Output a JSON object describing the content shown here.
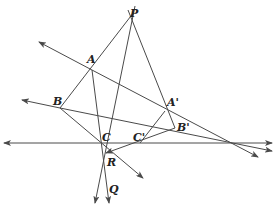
{
  "diagram": {
    "colors": {
      "line": "#4a4a4a",
      "label": "#222222",
      "background": "#ffffff"
    },
    "points": {
      "P": {
        "label": "P",
        "x": 129,
        "y": 14
      },
      "A": {
        "label": "A",
        "x": 92,
        "y": 70
      },
      "B": {
        "label": "B",
        "x": 60,
        "y": 108
      },
      "C": {
        "label": "C",
        "x": 102,
        "y": 143
      },
      "A_prime": {
        "label": "A'",
        "x": 165,
        "y": 111
      },
      "B_prime": {
        "label": "B'",
        "x": 175,
        "y": 128
      },
      "C_prime": {
        "label": "C'",
        "x": 140,
        "y": 143
      },
      "R": {
        "label": "R",
        "x": 106,
        "y": 153
      },
      "Q": {
        "label": "Q",
        "x": 107,
        "y": 182
      }
    },
    "labels": [
      {
        "id": "P",
        "text": "P",
        "x": 130,
        "y": 17
      },
      {
        "id": "A",
        "text": "A",
        "x": 87,
        "y": 63
      },
      {
        "id": "B",
        "text": "B",
        "x": 53,
        "y": 105
      },
      {
        "id": "C",
        "text": "C",
        "x": 102,
        "y": 141
      },
      {
        "id": "A_prime",
        "text": "A'",
        "x": 167,
        "y": 106
      },
      {
        "id": "B_prime",
        "text": "B'",
        "x": 177,
        "y": 131
      },
      {
        "id": "C_prime",
        "text": "C'",
        "x": 133,
        "y": 141
      },
      {
        "id": "R",
        "text": "R",
        "x": 107,
        "y": 166
      },
      {
        "id": "Q",
        "text": "Q",
        "x": 109,
        "y": 193
      }
    ]
  }
}
